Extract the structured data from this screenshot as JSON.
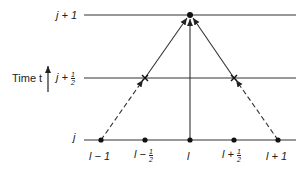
{
  "axis": {
    "label": "Time t",
    "levels": [
      {
        "name": "j + 1",
        "main": "j + 1"
      },
      {
        "name": "j + 1/2",
        "main": "j +",
        "num": "1",
        "den": "2"
      },
      {
        "name": "j",
        "main": "j"
      }
    ]
  },
  "points": [
    {
      "main": "l − 1"
    },
    {
      "main": "l −",
      "num": "1",
      "den": "2"
    },
    {
      "main": "l"
    },
    {
      "main": "l +",
      "num": "1",
      "den": "2"
    },
    {
      "main": "l + 1"
    }
  ],
  "colors": {
    "ink": "#222222"
  }
}
